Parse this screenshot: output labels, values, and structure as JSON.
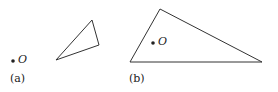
{
  "figures": [
    {
      "label": "(a)",
      "point_label": "O",
      "triangle": [
        [
          56,
          60
        ],
        [
          92,
          20
        ],
        [
          99,
          45
        ]
      ],
      "point": [
        13,
        61
      ]
    },
    {
      "label": "(b)",
      "point_label": "O",
      "triangle": [
        [
          130,
          62
        ],
        [
          160,
          9
        ],
        [
          262,
          62
        ]
      ],
      "point": [
        153,
        43
      ]
    }
  ],
  "colors": {
    "stroke": "#333333",
    "text": "#222222"
  }
}
